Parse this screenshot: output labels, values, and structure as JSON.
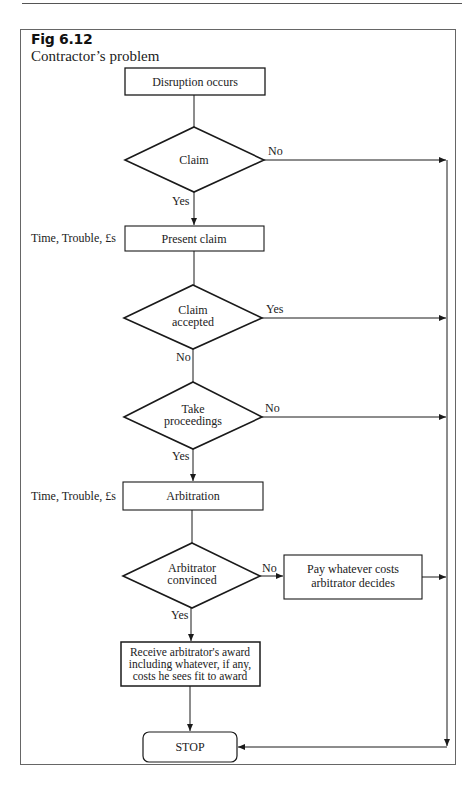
{
  "figure": {
    "label": "Fig 6.12",
    "title": "Contractor’s problem"
  },
  "nodes": {
    "start": {
      "type": "process",
      "label": "Disruption occurs"
    },
    "claim": {
      "type": "decision",
      "label": "Claim"
    },
    "present_claim": {
      "type": "process",
      "label": "Present claim",
      "side_note": "Time, Trouble, £s"
    },
    "claim_accepted": {
      "type": "decision",
      "label_line1": "Claim",
      "label_line2": "accepted"
    },
    "take_proceedings": {
      "type": "decision",
      "label_line1": "Take",
      "label_line2": "proceedings"
    },
    "arbitration": {
      "type": "process",
      "label": "Arbitration",
      "side_note": "Time, Trouble, £s"
    },
    "arbitrator_convinced": {
      "type": "decision",
      "label_line1": "Arbitrator",
      "label_line2": "convinced"
    },
    "pay_costs": {
      "type": "process",
      "label_line1": "Pay whatever costs",
      "label_line2": "arbitrator decides"
    },
    "receive_award": {
      "type": "process",
      "label_line1": "Receive arbitrator's award",
      "label_line2": "including whatever, if any,",
      "label_line3": "costs he sees fit to award"
    },
    "stop": {
      "type": "terminator",
      "label": "STOP"
    }
  },
  "edges": {
    "claim_no": "No",
    "claim_yes": "Yes",
    "accepted_yes": "Yes",
    "accepted_no": "No",
    "proceedings_no": "No",
    "proceedings_yes": "Yes",
    "convinced_no": "No",
    "convinced_yes": "Yes"
  },
  "colors": {
    "stroke": "#1a1a1a",
    "frame": "#666666",
    "background": "#ffffff"
  }
}
